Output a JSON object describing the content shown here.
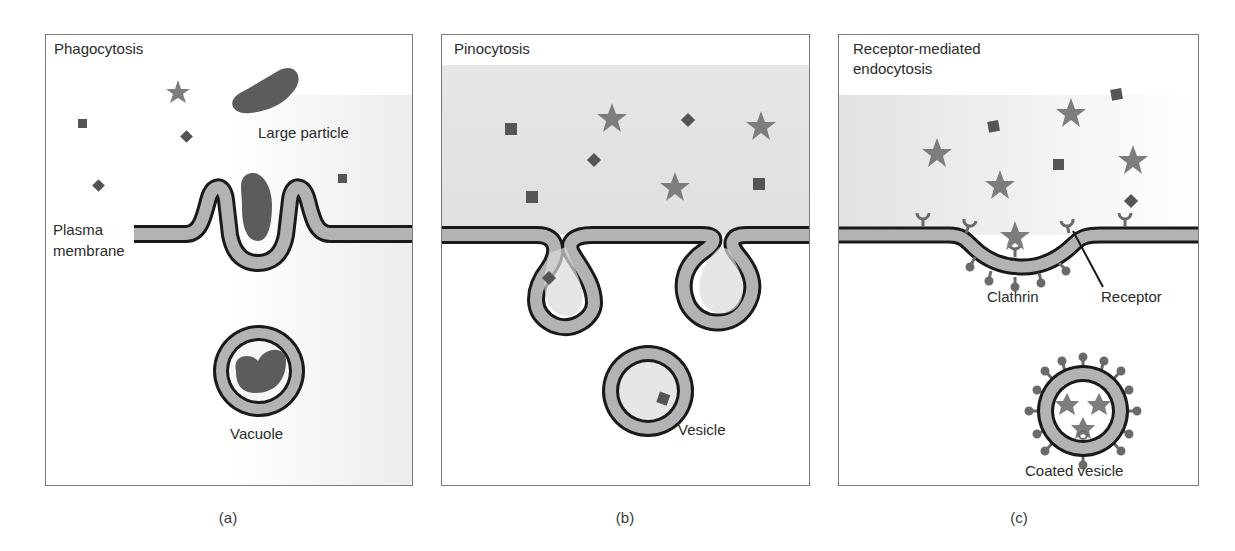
{
  "figure": {
    "panels": [
      {
        "id": "a",
        "title": "Phagocytosis",
        "caption": "(a)",
        "labels": {
          "large_particle": "Large particle",
          "plasma_membrane_line1": "Plasma",
          "plasma_membrane_line2": "membrane",
          "vacuole": "Vacuole"
        }
      },
      {
        "id": "b",
        "title": "Pinocytosis",
        "caption": "(b)",
        "labels": {
          "vesicle": "Vesicle"
        }
      },
      {
        "id": "c",
        "title_line1": "Receptor-mediated",
        "title_line2": "endocytosis",
        "caption": "(c)",
        "labels": {
          "clathrin": "Clathrin",
          "receptor": "Receptor",
          "coated_vesicle": "Coated vesicle"
        }
      }
    ],
    "colors": {
      "membrane_fill": "#b3b3b3",
      "membrane_stroke": "#1a1a1a",
      "particle": "#5c5c5c",
      "star": "#7d7d7d",
      "square": "#555555",
      "extracellular_bg": "#e4e4e4"
    }
  }
}
